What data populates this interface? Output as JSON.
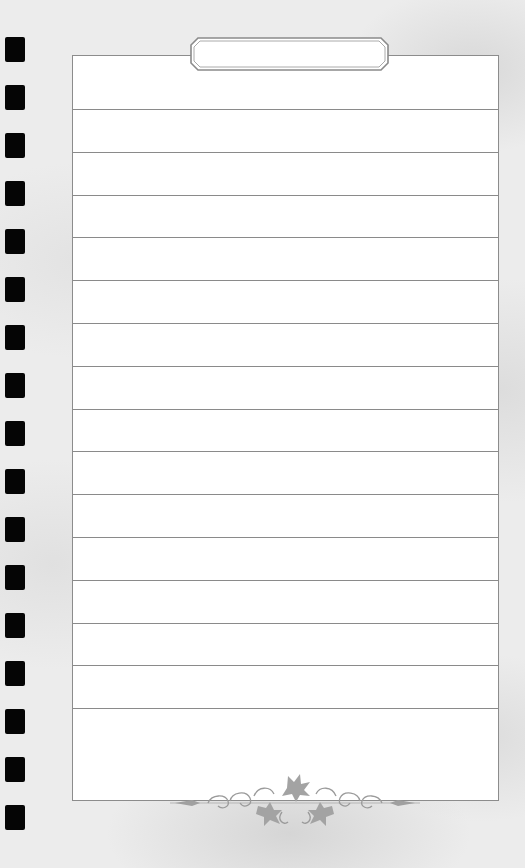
{
  "page": {
    "type": "lined-notepad-page",
    "title_tab": {
      "text": ""
    },
    "binder_holes": {
      "count": 17,
      "color": "#050505"
    },
    "lines": {
      "count": 15,
      "color": "#8a8a8a"
    },
    "frame": {
      "border_color": "#8c8c8c",
      "background": "#ffffff"
    },
    "ornament": {
      "icon": "floral-vine-ornament-icon",
      "color": "#9a9a9a"
    },
    "background_color": "#ececec"
  }
}
